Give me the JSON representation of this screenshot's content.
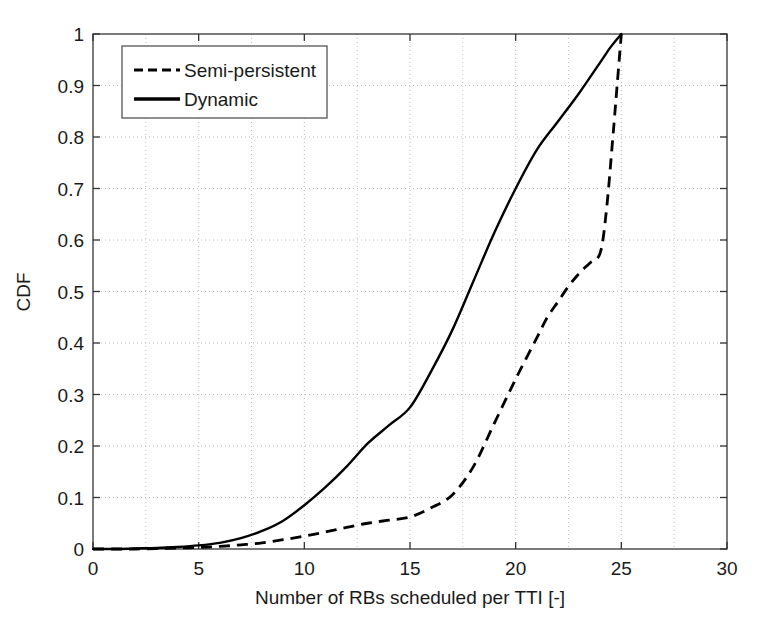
{
  "chart_data": {
    "type": "line",
    "title": "",
    "xlabel": "Number of RBs scheduled per TTI [-]",
    "ylabel": "CDF",
    "xlim": [
      0,
      30
    ],
    "ylim": [
      0,
      1
    ],
    "xticks": [
      0,
      5,
      10,
      15,
      20,
      25,
      30
    ],
    "xtick_labels": [
      "0",
      "5",
      "10",
      "15",
      "20",
      "25",
      "30"
    ],
    "yticks": [
      0,
      0.1,
      0.2,
      0.3,
      0.4,
      0.5,
      0.6,
      0.7,
      0.8,
      0.9,
      1
    ],
    "ytick_labels": [
      "0",
      "0.1",
      "0.2",
      "0.3",
      "0.4",
      "0.5",
      "0.6",
      "0.7",
      "0.8",
      "0.9",
      "1"
    ],
    "grid": true,
    "grid_style": "dotted",
    "grid_color": "#b4b4b4",
    "minor_grid_x": [
      2.5,
      7.5,
      12.5,
      17.5,
      22.5,
      27.5
    ],
    "legend_position": "upper left",
    "series": [
      {
        "name": "Semi-persistent",
        "style": "dashed",
        "color": "#000000",
        "line_width": 2.6,
        "x": [
          0,
          1,
          2,
          3,
          4,
          5,
          6,
          7,
          8,
          9,
          10,
          11,
          12,
          13,
          14,
          15,
          16,
          17,
          18,
          19,
          20,
          21,
          21.5,
          22,
          22.5,
          23,
          23.5,
          24,
          24.3,
          24.6,
          24.8,
          25
        ],
        "y": [
          0,
          0,
          0,
          0.001,
          0.002,
          0.003,
          0.005,
          0.008,
          0.012,
          0.018,
          0.025,
          0.033,
          0.042,
          0.05,
          0.056,
          0.062,
          0.08,
          0.105,
          0.16,
          0.245,
          0.33,
          0.41,
          0.45,
          0.48,
          0.51,
          0.535,
          0.555,
          0.575,
          0.66,
          0.8,
          0.9,
          1.0
        ]
      },
      {
        "name": "Dynamic",
        "style": "solid",
        "color": "#000000",
        "line_width": 2.6,
        "x": [
          0,
          1,
          2,
          3,
          4,
          5,
          6,
          7,
          8,
          9,
          10,
          11,
          12,
          13,
          14,
          15,
          16,
          17,
          18,
          19,
          20,
          21,
          22,
          23,
          24,
          24.5,
          25
        ],
        "y": [
          0,
          0,
          0.001,
          0.002,
          0.004,
          0.007,
          0.012,
          0.021,
          0.035,
          0.055,
          0.085,
          0.12,
          0.16,
          0.205,
          0.24,
          0.275,
          0.345,
          0.425,
          0.52,
          0.615,
          0.7,
          0.775,
          0.83,
          0.885,
          0.945,
          0.975,
          1.0
        ]
      }
    ]
  },
  "legend": {
    "items": [
      {
        "label": "Semi-persistent",
        "style": "dashed"
      },
      {
        "label": "Dynamic",
        "style": "solid"
      }
    ]
  },
  "axes": {
    "x_title": "Number of RBs scheduled per TTI [-]",
    "y_title": "CDF",
    "x_tick_labels": [
      "0",
      "5",
      "10",
      "15",
      "20",
      "25",
      "30"
    ],
    "y_tick_labels": [
      "0",
      "0.1",
      "0.2",
      "0.3",
      "0.4",
      "0.5",
      "0.6",
      "0.7",
      "0.8",
      "0.9",
      "1"
    ]
  }
}
